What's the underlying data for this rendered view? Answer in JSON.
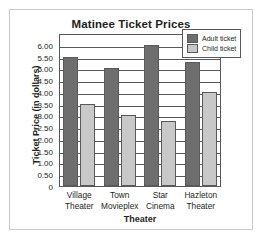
{
  "chart_data": {
    "type": "bar",
    "title": "Matinee Ticket Prices",
    "xlabel": "Theater",
    "ylabel": "Ticket Price (in dollars)",
    "categories": [
      "Village Theater",
      "Town Movieplex",
      "Star Cinema",
      "Hazleton Theater"
    ],
    "category_lines": [
      [
        "Village",
        "Theater"
      ],
      [
        "Town",
        "Movieplex"
      ],
      [
        "Star",
        "Cinema"
      ],
      [
        "Hazleton",
        "Theater"
      ]
    ],
    "series": [
      {
        "name": "Adult ticket",
        "color": "#6e6e6e",
        "values": [
          5.5,
          5.0,
          6.0,
          5.25
        ]
      },
      {
        "name": "Child ticket",
        "color": "#c8c8c8",
        "values": [
          3.5,
          3.0,
          2.75,
          4.0
        ]
      }
    ],
    "ylim": [
      0,
      6.5
    ],
    "ytick_values": [
      6.0,
      5.5,
      5.0,
      4.5,
      4.0,
      3.5,
      3.0,
      2.5,
      2.0,
      1.5,
      1.0,
      0.5,
      0
    ],
    "ytick_labels": [
      "6.00",
      "5.50",
      "5.00",
      "4.50",
      "4.00",
      "3.50",
      "3.00",
      "2.50",
      "2.00",
      "1.50",
      "1.00",
      "0.50",
      "0"
    ],
    "grid": true,
    "legend_position": "top-right"
  }
}
